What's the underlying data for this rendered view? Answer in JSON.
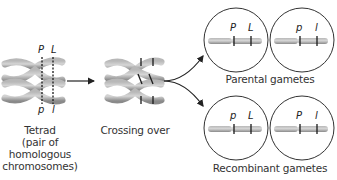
{
  "diagram": {
    "stages": [
      {
        "id": "tetrad",
        "label_lines": [
          "Tetrad",
          "(pair of",
          "homologous",
          "chromosomes)"
        ],
        "top_alleles": [
          "P",
          "L"
        ],
        "bottom_alleles": [
          "p",
          "l"
        ]
      },
      {
        "id": "crossing-over",
        "label": "Crossing over"
      }
    ],
    "gametes": {
      "parental": {
        "label": "Parental gametes",
        "chromosomes": [
          {
            "alleles": [
              "P",
              "L"
            ]
          },
          {
            "alleles": [
              "p",
              "l"
            ]
          }
        ]
      },
      "recombinant": {
        "label": "Recombinant gametes",
        "chromosomes": [
          {
            "alleles": [
              "p",
              "L"
            ]
          },
          {
            "alleles": [
              "P",
              "l"
            ]
          }
        ]
      }
    },
    "colors": {
      "chromosome": "#9a9a9a",
      "chromosome_light": "#c4c4c4",
      "band": "#1a1a1a",
      "arrow": "#222222",
      "circle": "#333333",
      "text": "#333333"
    }
  }
}
